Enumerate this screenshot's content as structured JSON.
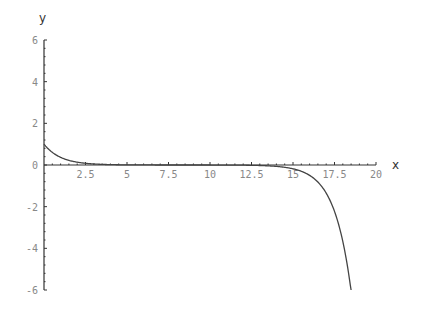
{
  "chart_data": {
    "type": "line",
    "title": "",
    "xlabel": "x",
    "ylabel": "y",
    "xlim": [
      0,
      20
    ],
    "ylim": [
      -6,
      6
    ],
    "grid": false,
    "x_ticks": [
      "2.5",
      "5",
      "7.5",
      "10",
      "12.5",
      "15",
      "17.5",
      "20"
    ],
    "y_ticks": [
      "6",
      "4",
      "2",
      "0",
      "-2",
      "-4",
      "-6"
    ],
    "series": [
      {
        "name": "f(x)",
        "x": [
          0,
          0.5,
          1,
          1.5,
          2,
          2.5,
          3,
          4,
          5,
          7.5,
          10,
          12.5,
          14,
          15,
          15.5,
          16,
          16.5,
          17,
          17.5,
          18,
          18.5
        ],
        "values": [
          1.0,
          0.61,
          0.37,
          0.22,
          0.14,
          0.08,
          0.05,
          0.02,
          0.01,
          0.0,
          0.0,
          -0.01,
          -0.07,
          -0.18,
          -0.3,
          -0.5,
          -0.82,
          -1.35,
          -2.23,
          -3.67,
          -6.0
        ]
      }
    ],
    "color": "#444444"
  }
}
